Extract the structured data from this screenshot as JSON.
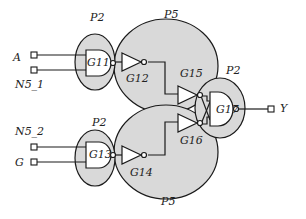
{
  "diagram": {
    "colors": {
      "region_fill": "#d9d9d9",
      "stroke": "#1a1a1a",
      "background": "#ffffff"
    },
    "partitions": [
      {
        "id": "p2-top",
        "label": "P2"
      },
      {
        "id": "p5-top",
        "label": "P5"
      },
      {
        "id": "p2-right",
        "label": "P2"
      },
      {
        "id": "p2-bottom",
        "label": "P2"
      },
      {
        "id": "p5-bottom",
        "label": "P5"
      }
    ],
    "inputs": [
      {
        "id": "A",
        "label": "A"
      },
      {
        "id": "N5_1",
        "label": "N5_1"
      },
      {
        "id": "N5_2",
        "label": "N5_2"
      },
      {
        "id": "G",
        "label": "G"
      }
    ],
    "outputs": [
      {
        "id": "Y",
        "label": "Y"
      }
    ],
    "gates": [
      {
        "id": "G11",
        "label": "G11",
        "type": "NAND"
      },
      {
        "id": "G12",
        "label": "G12",
        "type": "NOT"
      },
      {
        "id": "G13",
        "label": "G13",
        "type": "NAND"
      },
      {
        "id": "G14",
        "label": "G14",
        "type": "NOT"
      },
      {
        "id": "G15",
        "label": "G15",
        "type": "NOT"
      },
      {
        "id": "G16",
        "label": "G16",
        "type": "NOT"
      },
      {
        "id": "G17",
        "label": "G17",
        "type": "NAND"
      }
    ]
  }
}
